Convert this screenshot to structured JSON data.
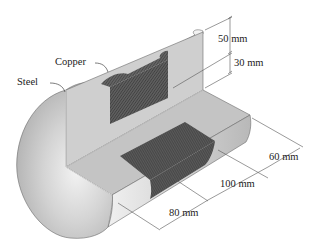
{
  "figure": {
    "materials": [
      {
        "id": "copper",
        "label": "Copper"
      },
      {
        "id": "steel",
        "label": "Steel"
      }
    ],
    "dimensions": [
      {
        "id": "outer-radius",
        "label": "50 mm"
      },
      {
        "id": "inner-radius",
        "label": "30 mm"
      },
      {
        "id": "segment-a",
        "label": "60 mm"
      },
      {
        "id": "segment-b",
        "label": "100 mm"
      },
      {
        "id": "segment-c",
        "label": "80 mm"
      }
    ],
    "colors": {
      "steel_light": "#e6e6e6",
      "steel_mid": "#c9c9c9",
      "steel_dark": "#9a9a9a",
      "copper_hatch": "#4a4a4a",
      "line": "#555555"
    }
  }
}
